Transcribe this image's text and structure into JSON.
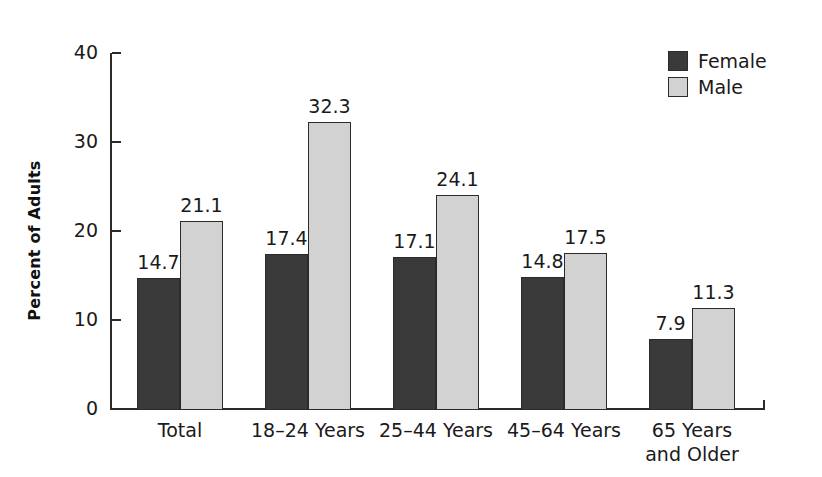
{
  "chart_data": {
    "type": "bar",
    "title": "",
    "subtitle": "",
    "xlabel": "",
    "ylabel": "Percent of Adults",
    "ylim": [
      0,
      40
    ],
    "yticks": [
      0,
      10,
      20,
      30,
      40
    ],
    "ytick_labels": [
      "0",
      "10",
      "20",
      "30",
      "40"
    ],
    "grid": false,
    "legend_position": "top-right",
    "categories": [
      "Total",
      "18–24 Years",
      "25–44 Years",
      "45–64 Years",
      "65 Years\nand Older"
    ],
    "series": [
      {
        "name": "Female",
        "color": "#3a3a3a",
        "values": [
          14.7,
          17.4,
          17.1,
          14.8,
          7.9
        ],
        "value_labels": [
          "14.7",
          "17.4",
          "17.1",
          "14.8",
          "7.9"
        ]
      },
      {
        "name": "Male",
        "color": "#d2d2d2",
        "values": [
          21.1,
          32.3,
          24.1,
          17.5,
          11.3
        ],
        "value_labels": [
          "21.1",
          "32.3",
          "24.1",
          "17.5",
          "11.3"
        ]
      }
    ]
  },
  "legend": {
    "items": [
      {
        "label": "Female",
        "color": "#3a3a3a"
      },
      {
        "label": "Male",
        "color": "#d2d2d2"
      }
    ]
  },
  "colors": {
    "female": "#3a3a3a",
    "male": "#d2d2d2",
    "axis": "#2b2b2b",
    "text": "#1a1a1a",
    "background": "#ffffff"
  }
}
